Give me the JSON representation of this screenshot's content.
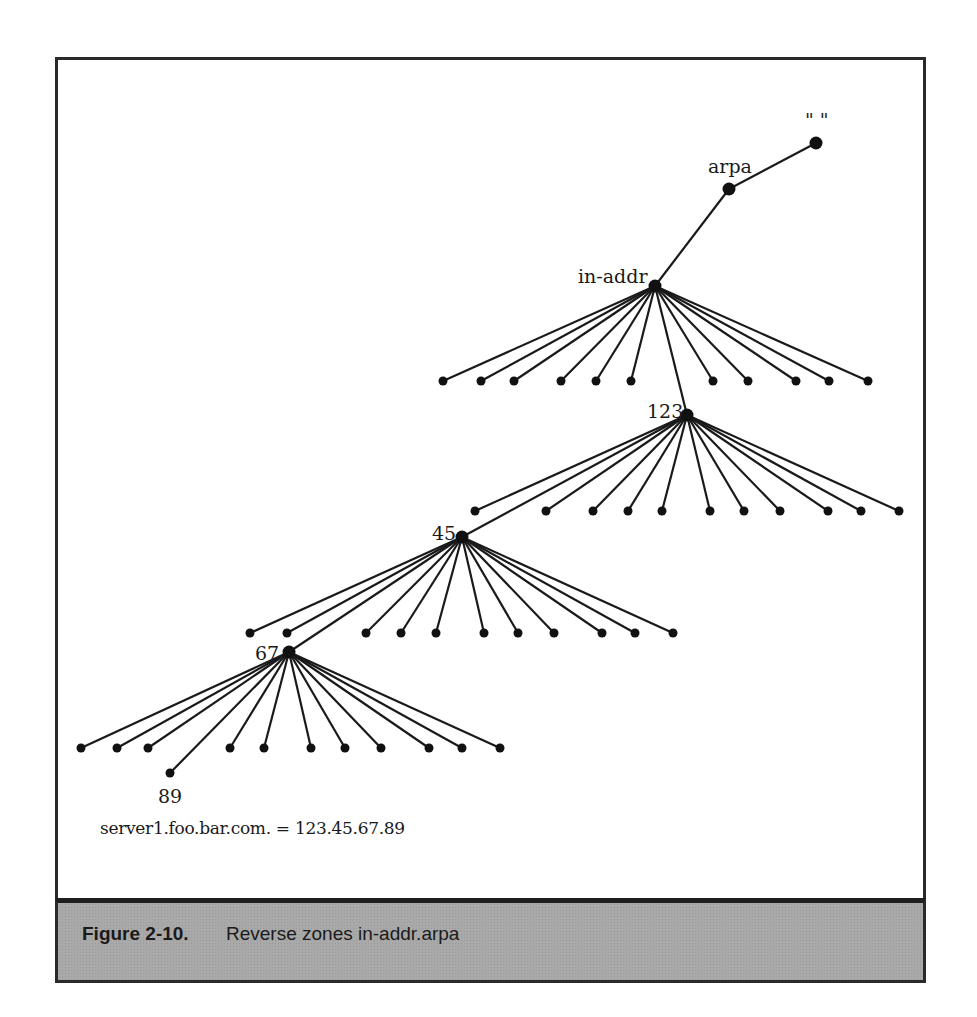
{
  "figure": {
    "number": "Figure 2-10.",
    "caption": "Reverse zones in-addr.arpa",
    "mapping": "server1.foo.bar.com. = 123.45.67.89"
  },
  "tree": {
    "nodes": [
      {
        "id": "root",
        "label": "\" \"",
        "x": 816,
        "y": 143,
        "label_x": 805,
        "label_y": 127
      },
      {
        "id": "arpa",
        "label": "arpa",
        "x": 729,
        "y": 189,
        "label_x": 708,
        "label_y": 173
      },
      {
        "id": "in-addr",
        "label": "in-addr",
        "x": 655,
        "y": 286,
        "label_x": 578,
        "label_y": 283
      },
      {
        "id": "123",
        "label": "123",
        "x": 687,
        "y": 415,
        "label_x": 647,
        "label_y": 418
      },
      {
        "id": "45",
        "label": "45",
        "x": 462,
        "y": 537,
        "label_x": 432,
        "label_y": 540
      },
      {
        "id": "67",
        "label": "67",
        "x": 289,
        "y": 652,
        "label_x": 255,
        "label_y": 660
      },
      {
        "id": "89",
        "label": "89",
        "x": 170,
        "y": 773,
        "label_x": 158,
        "label_y": 803
      }
    ],
    "edges": [
      [
        "root",
        "arpa"
      ],
      [
        "arpa",
        "in-addr"
      ],
      [
        "in-addr",
        "123"
      ],
      [
        "123",
        "45"
      ],
      [
        "45",
        "67"
      ],
      [
        "67",
        "89"
      ]
    ],
    "leaf_groups": [
      {
        "parent": "in-addr",
        "y": 381,
        "xs": [
          443,
          481,
          514,
          561,
          596,
          631,
          713,
          748,
          796,
          829,
          868
        ]
      },
      {
        "parent": "123",
        "y": 511,
        "xs": [
          475,
          546,
          593,
          628,
          662,
          710,
          744,
          780,
          828,
          861,
          899
        ]
      },
      {
        "parent": "45",
        "y": 633,
        "xs": [
          250,
          287,
          366,
          401,
          436,
          484,
          518,
          554,
          602,
          635,
          673
        ]
      },
      {
        "parent": "67",
        "y": 748,
        "xs": [
          81,
          117,
          148,
          230,
          264,
          311,
          345,
          381,
          429,
          462,
          500
        ]
      }
    ]
  },
  "colors": {
    "line": "#1a1a1a",
    "caption_bg": "#a9a9a9",
    "border": "#2a2a2a"
  }
}
